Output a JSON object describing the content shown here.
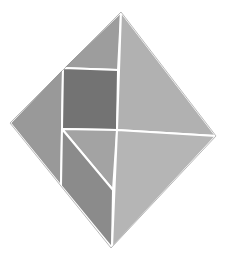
{
  "figure": {
    "type": "tangram-diamond",
    "background": "#ffffff",
    "outer_vertices": {
      "top": [
        121,
        12
      ],
      "left": [
        10,
        123
      ],
      "right": [
        216,
        136
      ],
      "bottom": [
        111,
        248
      ]
    },
    "pieces": [
      {
        "name": "top-left-triangle",
        "points": "121,12 63,68 118,70",
        "color": "#9d9d9d"
      },
      {
        "name": "left-triangle",
        "points": "63,68 10,123 61,186",
        "color": "#999999"
      },
      {
        "name": "square",
        "points": "63,68 118,70 117,130 62,129",
        "color": "#737373"
      },
      {
        "name": "right-large-triangle",
        "points": "121,12 216,136 117,130",
        "color": "#b1b1b1"
      },
      {
        "name": "middle-small-triangle",
        "points": "62,129 117,130 113,190",
        "color": "#a3a3a3"
      },
      {
        "name": "parallelogram",
        "points": "62,129 113,190 112,248 61,186",
        "color": "#8b8b8b"
      },
      {
        "name": "bottom-right-triangle",
        "points": "117,130 216,136 112,248",
        "color": "#b5b5b5"
      }
    ]
  }
}
